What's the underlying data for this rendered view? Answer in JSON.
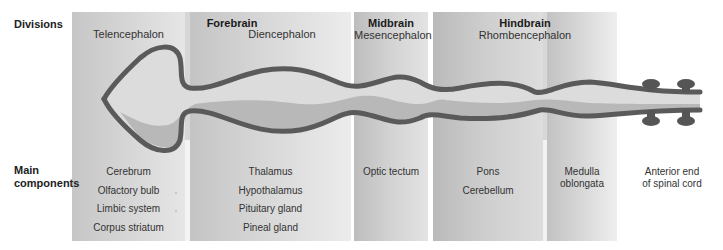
{
  "row_labels": {
    "divisions": "Divisions",
    "main_components": [
      "Main",
      "components"
    ]
  },
  "divisions": [
    {
      "name": "Forebrain",
      "subdivisions": [
        "Telencephalon",
        "Diencephalon"
      ]
    },
    {
      "name": "Midbrain",
      "subdivisions": [
        "Mesencephalon"
      ]
    },
    {
      "name": "Hindbrain",
      "subdivisions": [
        "Rhombencephalon"
      ]
    }
  ],
  "components": {
    "telencephalon": [
      "Cerebrum",
      "Olfactory bulb",
      "Limbic system",
      "Corpus striatum"
    ],
    "diencephalon": [
      "Thalamus",
      "Hypothalamus",
      "Pituitary gland",
      "Pineal gland"
    ],
    "mesencephalon": [
      "Optic tectum"
    ],
    "pons_region": [
      "Pons",
      "Cerebellum"
    ],
    "medulla_region": [
      "Medulla",
      "oblongata"
    ],
    "spinal": [
      "Anterior end",
      "of spinal cord"
    ]
  },
  "colors": {
    "tube_wall": "#5a5a5a",
    "tube_lumen": "#d9d9d9",
    "tube_floor": "#b5b5b5",
    "panel_gray": "#cfcfcf"
  }
}
